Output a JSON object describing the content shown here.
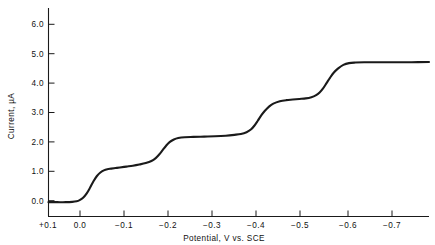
{
  "chart_data": {
    "type": "line",
    "title": "",
    "subtitle": "",
    "xlabel": "Potential, V vs. SCE",
    "ylabel": "Current, µA",
    "xlim": [
      0.1,
      -0.78
    ],
    "ylim": [
      -0.45,
      6.45
    ],
    "grid": false,
    "legend": null,
    "x_ticks": [
      {
        "value": 0.1,
        "label": "+0.1"
      },
      {
        "value": 0.0,
        "label": "0.0"
      },
      {
        "value": -0.1,
        "label": "−0.1"
      },
      {
        "value": -0.2,
        "label": "−0.2"
      },
      {
        "value": -0.3,
        "label": "−0.3"
      },
      {
        "value": -0.4,
        "label": "−0.4"
      },
      {
        "value": -0.5,
        "label": "−0.5"
      },
      {
        "value": -0.6,
        "label": "−0.6"
      },
      {
        "value": -0.7,
        "label": "−0.7"
      }
    ],
    "y_ticks": [
      {
        "value": 0.0,
        "label": "0.0"
      },
      {
        "value": 1.0,
        "label": "1.0"
      },
      {
        "value": 2.0,
        "label": "2.0"
      },
      {
        "value": 3.0,
        "label": "3.0"
      },
      {
        "value": 4.0,
        "label": "4.0"
      },
      {
        "value": 5.0,
        "label": "5.0"
      },
      {
        "value": 6.0,
        "label": "6.0"
      }
    ],
    "series": [
      {
        "name": "polarographic wave",
        "color": "#1a1a1a",
        "x": [
          0.1,
          0.08,
          0.06,
          0.045,
          0.035,
          0.028,
          0.02,
          0.012,
          0.004,
          -0.004,
          -0.012,
          -0.02,
          -0.028,
          -0.036,
          -0.045,
          -0.055,
          -0.065,
          -0.08,
          -0.095,
          -0.11,
          -0.125,
          -0.138,
          -0.148,
          -0.156,
          -0.164,
          -0.172,
          -0.18,
          -0.19,
          -0.2,
          -0.215,
          -0.235,
          -0.26,
          -0.285,
          -0.31,
          -0.33,
          -0.345,
          -0.358,
          -0.368,
          -0.376,
          -0.384,
          -0.392,
          -0.4,
          -0.41,
          -0.42,
          -0.435,
          -0.45,
          -0.465,
          -0.48,
          -0.495,
          -0.508,
          -0.518,
          -0.527,
          -0.535,
          -0.543,
          -0.551,
          -0.56,
          -0.57,
          -0.582,
          -0.595,
          -0.61,
          -0.63,
          -0.66,
          -0.7,
          -0.74,
          -0.78
        ],
        "y": [
          -0.05,
          -0.05,
          -0.05,
          -0.04,
          -0.02,
          0.02,
          0.1,
          0.24,
          0.44,
          0.66,
          0.84,
          0.96,
          1.03,
          1.07,
          1.09,
          1.11,
          1.13,
          1.16,
          1.19,
          1.23,
          1.28,
          1.35,
          1.45,
          1.57,
          1.72,
          1.87,
          1.99,
          2.08,
          2.13,
          2.16,
          2.17,
          2.18,
          2.19,
          2.21,
          2.24,
          2.27,
          2.33,
          2.42,
          2.55,
          2.72,
          2.9,
          3.05,
          3.2,
          3.3,
          3.38,
          3.42,
          3.44,
          3.46,
          3.48,
          3.52,
          3.58,
          3.68,
          3.82,
          4.0,
          4.18,
          4.36,
          4.5,
          4.62,
          4.68,
          4.7,
          4.71,
          4.71,
          4.71,
          4.71,
          4.72
        ]
      }
    ],
    "annotations": [
      {
        "text": "wave 1 plateau ≈ 1.1 µA",
        "x": -0.06,
        "y": 1.1
      },
      {
        "text": "wave 2 plateau ≈ 2.2 µA",
        "x": -0.26,
        "y": 2.2
      },
      {
        "text": "wave 3 plateau ≈ 3.45 µA",
        "x": -0.46,
        "y": 3.45
      },
      {
        "text": "wave 4 plateau ≈ 4.7 µA",
        "x": -0.68,
        "y": 4.7
      }
    ],
    "half_wave_potentials": [
      -0.02,
      -0.165,
      -0.39,
      -0.545
    ]
  }
}
